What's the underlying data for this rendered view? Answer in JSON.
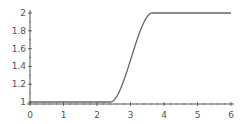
{
  "chart_data": {
    "type": "line",
    "title": "",
    "xlabel": "",
    "ylabel": "",
    "xlim": [
      0,
      6
    ],
    "ylim": [
      1,
      2
    ],
    "grid": false,
    "legend": null,
    "x_ticks": [
      0,
      1,
      2,
      3,
      4,
      5,
      6
    ],
    "x_tick_labels": [
      "0",
      "1",
      "2",
      "3",
      "4",
      "5",
      "6"
    ],
    "y_ticks": [
      1,
      1.2,
      1.4,
      1.6,
      1.8,
      2
    ],
    "y_tick_labels": [
      "1",
      "1.2",
      "1.4",
      "1.6",
      "1.8",
      "2"
    ],
    "series": [
      {
        "name": "curve",
        "color": "#666666",
        "x": [
          0,
          0.5,
          1,
          1.5,
          2,
          2.4,
          2.6,
          2.8,
          3.0,
          3.2,
          3.4,
          3.6,
          4,
          4.5,
          5,
          5.5,
          6
        ],
        "y": [
          1,
          1,
          1,
          1,
          1,
          1,
          1.07,
          1.26,
          1.5,
          1.74,
          1.93,
          2,
          2,
          2,
          2,
          2,
          2
        ]
      }
    ]
  },
  "colors": {
    "axis": "#555555",
    "line": "#666666",
    "background": "#ffffff"
  }
}
